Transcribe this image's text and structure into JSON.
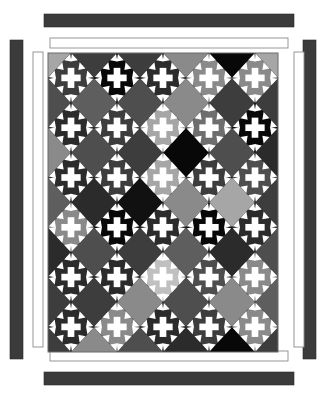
{
  "artwork": {
    "title": "Album Cross / Chimney Sweep Quilt Diagram",
    "type": "quilt-pattern-diagram",
    "canvas": {
      "width": 317,
      "height": 399,
      "background": "#ffffff"
    }
  },
  "palette": {
    "white": "#ffffff",
    "black": "#080808",
    "near_black": "#111111",
    "charcoal": "#2b2b2b",
    "dark_gray": "#3d3d3d",
    "mid_dark_gray": "#4e4e4e",
    "mid_gray": "#5e5e5e",
    "gray": "#6e6e6e",
    "light_mid_gray": "#8a8a8a",
    "light_gray": "#a6a6a6",
    "pale_gray": "#c0c0c0",
    "border_stroke": "#7a7a7a",
    "sashing": "#4a4a4a"
  },
  "borders": {
    "outer_dark": {
      "name": "outer-dark-border-strip",
      "color": "#3b3b3b",
      "top": {
        "x": 44,
        "y": 14,
        "w": 250,
        "h": 13
      },
      "bottom": {
        "x": 44,
        "y": 372,
        "w": 250,
        "h": 13
      },
      "left": {
        "x": 10,
        "y": 40,
        "w": 13,
        "h": 319
      },
      "right": {
        "x": 303,
        "y": 40,
        "w": 13,
        "h": 319
      }
    },
    "inner_white": {
      "name": "inner-white-border-strip",
      "color": "#ffffff",
      "stroke": "#8c8c8c",
      "top": {
        "x": 50,
        "y": 38,
        "w": 238,
        "h": 10
      },
      "bottom": {
        "x": 50,
        "y": 351,
        "w": 238,
        "h": 10
      },
      "left": {
        "x": 33,
        "y": 52,
        "w": 10,
        "h": 295
      },
      "right": {
        "x": 294,
        "y": 52,
        "w": 10,
        "h": 295
      }
    }
  },
  "quilt_body": {
    "name": "quilt-center-panel",
    "x": 48,
    "y": 53,
    "w": 230,
    "h": 299,
    "background": "#4a4a4a",
    "columns": 5,
    "rows": 6,
    "block_pitch_x": 46.0,
    "block_pitch_y": 49.8,
    "cross_color": "#ffffff"
  },
  "blocks": {
    "description": "Six rows of five on-point cross (album) blocks. field = diamond background behind the white cross.",
    "rows": [
      {
        "row": 1,
        "cells": [
          {
            "col": 1,
            "field": "#3d3d3d"
          },
          {
            "col": 2,
            "field": "#080808"
          },
          {
            "col": 3,
            "field": "#2b2b2b"
          },
          {
            "col": 4,
            "field": "#8a8a8a"
          },
          {
            "col": 5,
            "field": "#8a8a8a"
          }
        ]
      },
      {
        "row": 2,
        "cells": [
          {
            "col": 1,
            "field": "#2b2b2b"
          },
          {
            "col": 2,
            "field": "#3d3d3d"
          },
          {
            "col": 3,
            "field": "#a6a6a6"
          },
          {
            "col": 4,
            "field": "#6e6e6e"
          },
          {
            "col": 5,
            "field": "#080808"
          }
        ]
      },
      {
        "row": 3,
        "cells": [
          {
            "col": 1,
            "field": "#2b2b2b"
          },
          {
            "col": 2,
            "field": "#3d3d3d"
          },
          {
            "col": 3,
            "field": "#a6a6a6"
          },
          {
            "col": 4,
            "field": "#3d3d3d"
          },
          {
            "col": 5,
            "field": "#4e4e4e"
          }
        ]
      },
      {
        "row": 4,
        "cells": [
          {
            "col": 1,
            "field": "#8a8a8a"
          },
          {
            "col": 2,
            "field": "#080808"
          },
          {
            "col": 3,
            "field": "#2b2b2b"
          },
          {
            "col": 4,
            "field": "#080808"
          },
          {
            "col": 5,
            "field": "#2b2b2b"
          }
        ]
      },
      {
        "row": 5,
        "cells": [
          {
            "col": 1,
            "field": "#2b2b2b"
          },
          {
            "col": 2,
            "field": "#2b2b2b"
          },
          {
            "col": 3,
            "field": "#c0c0c0"
          },
          {
            "col": 4,
            "field": "#4e4e4e"
          },
          {
            "col": 5,
            "field": "#8a8a8a"
          }
        ]
      },
      {
        "row": 6,
        "cells": [
          {
            "col": 1,
            "field": "#2b2b2b"
          },
          {
            "col": 2,
            "field": "#8a8a8a"
          },
          {
            "col": 3,
            "field": "#2b2b2b"
          },
          {
            "col": 4,
            "field": "#3d3d3d"
          },
          {
            "col": 5,
            "field": "#8a8a8a"
          }
        ]
      }
    ]
  },
  "setting_squares": {
    "description": "Plain on-point setting diamonds sitting between the cross blocks (offset grid).",
    "rows": [
      {
        "row": 1,
        "cells": [
          "#a6a6a6",
          "#3d3d3d",
          "#3d3d3d",
          "#8a8a8a",
          "#080808",
          "#a6a6a6"
        ]
      },
      {
        "row": 2,
        "cells": [
          "#4e4e4e",
          "#5e5e5e",
          "#4e4e4e",
          "#8a8a8a",
          "#3d3d3d",
          "#3d3d3d"
        ]
      },
      {
        "row": 3,
        "cells": [
          "#8a8a8a",
          "#4e4e4e",
          "#3d3d3d",
          "#080808",
          "#4e4e4e",
          "#2b2b2b"
        ]
      },
      {
        "row": 4,
        "cells": [
          "#5e5e5e",
          "#2b2b2b",
          "#111111",
          "#8a8a8a",
          "#a6a6a6",
          "#3d3d3d"
        ]
      },
      {
        "row": 5,
        "cells": [
          "#2b2b2b",
          "#4e4e4e",
          "#3d3d3d",
          "#5e5e5e",
          "#2b2b2b",
          "#4e4e4e"
        ]
      },
      {
        "row": 6,
        "cells": [
          "#3d3d3d",
          "#3d3d3d",
          "#8a8a8a",
          "#4e4e4e",
          "#8a8a8a",
          "#5e5e5e"
        ]
      },
      {
        "row": 7,
        "cells": [
          "#3d3d3d",
          "#8a8a8a",
          "#4e4e4e",
          "#2b2b2b",
          "#080808",
          "#3d3d3d"
        ]
      }
    ]
  }
}
